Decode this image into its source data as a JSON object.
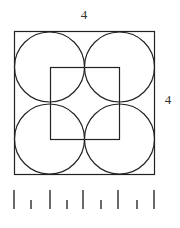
{
  "diagram": {
    "labels": {
      "top_side": "4",
      "right_side": "4"
    },
    "shapes": {
      "outer_square": {
        "side_length": 4
      },
      "circles": {
        "count": 4,
        "arrangement": "2x2 grid, each tangent to neighbors and outer square"
      },
      "inner_square": {
        "connects": "centers of the four circles"
      }
    },
    "ruler": {
      "long_ticks": 5,
      "short_ticks": 4
    },
    "colors": {
      "stroke": "#222222",
      "text": "#333333",
      "tick": "#444444"
    }
  }
}
